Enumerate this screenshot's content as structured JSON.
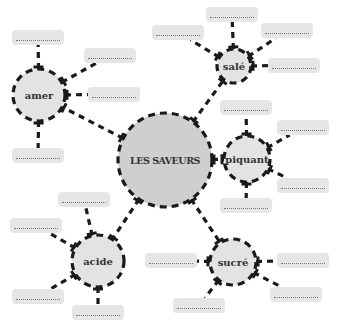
{
  "diagram": {
    "center": {
      "label": "LES SAVEURS",
      "fill": "#cfcfcf"
    },
    "branches": [
      {
        "id": "amer",
        "label": "amer",
        "answer_boxes": 4
      },
      {
        "id": "sale",
        "label": "salé",
        "answer_boxes": 4
      },
      {
        "id": "piquant",
        "label": "piquant",
        "answer_boxes": 4
      },
      {
        "id": "sucre",
        "label": "sucré",
        "answer_boxes": 4
      },
      {
        "id": "acide",
        "label": "acide",
        "answer_boxes": 4
      }
    ],
    "colors": {
      "line": "#1a1a1a",
      "node_fill": "#e3e3e3",
      "box_fill": "#e6e6e6",
      "dots": "#777777"
    }
  }
}
